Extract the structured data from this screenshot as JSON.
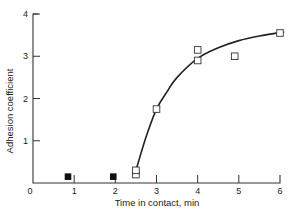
{
  "chart_data": {
    "type": "scatter",
    "title": "",
    "xlabel": "Time in contact, min",
    "ylabel": "Adhesion coefficient",
    "xlim": [
      0,
      6
    ],
    "ylim": [
      0,
      4
    ],
    "x_ticks": [
      "0",
      "1",
      "2",
      "3",
      "4",
      "5",
      "6"
    ],
    "y_ticks": [
      "1",
      "2",
      "3",
      "4"
    ],
    "grid": false,
    "legend": null,
    "series": [
      {
        "name": "filled",
        "marker": "filled-square",
        "points": [
          [
            0.85,
            0.15
          ],
          [
            1.95,
            0.15
          ]
        ]
      },
      {
        "name": "open",
        "marker": "open-square",
        "points": [
          [
            2.5,
            0.2
          ],
          [
            2.5,
            0.3
          ],
          [
            3.0,
            1.75
          ],
          [
            4.0,
            2.9
          ],
          [
            4.0,
            3.15
          ],
          [
            4.9,
            3.0
          ],
          [
            6.0,
            3.55
          ]
        ]
      },
      {
        "name": "fit-curve",
        "marker": "line",
        "points": [
          [
            2.5,
            0.3
          ],
          [
            2.75,
            1.1
          ],
          [
            3.0,
            1.75
          ],
          [
            3.25,
            2.15
          ],
          [
            3.5,
            2.5
          ],
          [
            4.0,
            2.95
          ],
          [
            4.5,
            3.2
          ],
          [
            5.0,
            3.37
          ],
          [
            5.5,
            3.48
          ],
          [
            6.0,
            3.56
          ],
          [
            6.1,
            3.57
          ]
        ]
      }
    ]
  }
}
